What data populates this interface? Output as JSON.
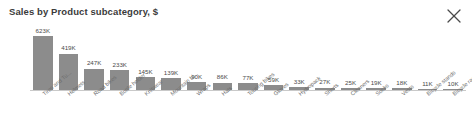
{
  "card": {
    "title": "Sales by Product subcategory, $",
    "close_icon": "close-icon",
    "background_color": "#ffffff",
    "bar_color": "#8c8c8c",
    "axis_color": "#c9c9c9",
    "title_color": "#3b3b3b",
    "label_color": "#6d6d6d"
  },
  "chart_data": {
    "type": "bar",
    "title": "Sales by Product subcategory, $",
    "xlabel": "",
    "ylabel": "",
    "grid": false,
    "legend": false,
    "ylim": [
      0,
      623000
    ],
    "value_suffix": "K",
    "categories": [
      "Tires and Tu...",
      "Helmets",
      "Road bikes",
      "Bottle holder",
      "Knitwear",
      "Mountain bi...",
      "Wraps",
      "Hats",
      "Touring bikes",
      "Gloves",
      "Hydropack",
      "Shorts",
      "Cleaners",
      "Socks",
      "Vests",
      "Bicycle stands",
      "Bicycle racks"
    ],
    "values": [
      623,
      419,
      247,
      233,
      145,
      139,
      90,
      86,
      77,
      59,
      33,
      27,
      25,
      19,
      18,
      11,
      10
    ],
    "labels": [
      "623K",
      "419K",
      "247K",
      "233K",
      "145K",
      "139K",
      "90K",
      "86K",
      "77K",
      "59K",
      "33K",
      "27K",
      "25K",
      "19K",
      "18K",
      "11K",
      "10K"
    ]
  }
}
